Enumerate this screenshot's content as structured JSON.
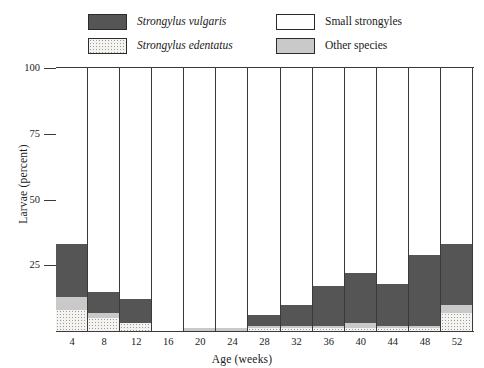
{
  "legend": {
    "entries": [
      {
        "label": "Strongylus vulgaris",
        "style": "sci",
        "swatch": "dark-gray-swatch",
        "color": "#555555"
      },
      {
        "label": "Small strongyles",
        "style": "normal",
        "swatch": "white-swatch",
        "color": "#ffffff"
      },
      {
        "label": "Strongylus edentatus",
        "style": "sci",
        "swatch": "stippled-swatch",
        "color": "#f4f3ef"
      },
      {
        "label": "Other species",
        "style": "normal",
        "swatch": "light-gray-swatch",
        "color": "#c9c9c9"
      }
    ]
  },
  "axes": {
    "ylabel": "Larvae (percent)",
    "xlabel": "Age (weeks)",
    "yticks": [
      "100",
      "75",
      "50",
      "25"
    ],
    "ymin": 0,
    "ymax": 100
  },
  "chart_data": {
    "type": "bar",
    "title": "",
    "xlabel": "Age (weeks)",
    "ylabel": "Larvae (percent)",
    "ylim": [
      0,
      100
    ],
    "grid": false,
    "legend_position": "top",
    "stacked": true,
    "categories": [
      "4",
      "8",
      "12",
      "16",
      "20",
      "24",
      "28",
      "32",
      "36",
      "40",
      "44",
      "48",
      "52"
    ],
    "series": [
      {
        "name": "Strongylus edentatus",
        "color": "#f4f3ef",
        "values": [
          8,
          5,
          3,
          0,
          0,
          0,
          1,
          1,
          1,
          1,
          1,
          1,
          7
        ]
      },
      {
        "name": "Other species",
        "color": "#c9c9c9",
        "values": [
          5,
          2,
          0,
          0,
          1,
          1,
          1,
          1,
          1,
          2,
          1,
          1,
          3
        ]
      },
      {
        "name": "Strongylus vulgaris",
        "color": "#555555",
        "values": [
          20,
          8,
          9,
          0,
          0,
          0,
          4,
          8,
          15,
          19,
          16,
          27,
          23
        ]
      },
      {
        "name": "Small strongyles",
        "color": "#ffffff",
        "values": [
          67,
          85,
          88,
          100,
          99,
          99,
          94,
          90,
          83,
          78,
          82,
          71,
          67
        ]
      }
    ]
  }
}
